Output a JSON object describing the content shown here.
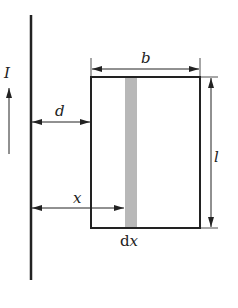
{
  "diagram": {
    "labels": {
      "current": "I",
      "distance_d": "d",
      "width_b": "b",
      "length_l": "l",
      "position_x": "x",
      "strip_d": "d",
      "strip_x": "x"
    },
    "colors": {
      "line": "#222222",
      "strip": "#b8b8b8",
      "background": "#ffffff"
    }
  }
}
